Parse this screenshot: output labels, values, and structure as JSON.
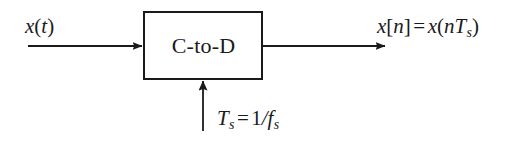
{
  "diagram": {
    "background_color": "#ffffff",
    "stroke_color": "#1a1a1a",
    "block": {
      "label": "C-to-D",
      "x": 143,
      "y": 11,
      "width": 120,
      "height": 69,
      "border_width": 2,
      "fill": "#ffffff"
    },
    "labels": {
      "input_signal": "x(t)",
      "output_signal": "x[n] = x(nTs)",
      "sampling_period": "Ts = 1/fs"
    },
    "label_parts": {
      "input": {
        "var": "x",
        "open": "(",
        "arg": "t",
        "close": ")"
      },
      "output": {
        "lhs_var": "x",
        "lhs_open": "[",
        "lhs_arg": "n",
        "lhs_close": "]",
        "operator": "=",
        "rhs_var": "x",
        "rhs_open": "(",
        "rhs_arg": "n",
        "rhs_sym": "T",
        "rhs_sub": "s",
        "rhs_close": ")"
      },
      "sampling": {
        "sym": "T",
        "sym_sub": "s",
        "operator": "=",
        "numerator": "1",
        "slash": "/",
        "denominator": "f",
        "denominator_sub": "s"
      }
    },
    "arrows": [
      {
        "name": "input-arrow",
        "direction": "right",
        "x1": 28,
        "y1": 46,
        "x2": 143,
        "y2": 46
      },
      {
        "name": "output-arrow",
        "direction": "right",
        "x1": 263,
        "y1": 46,
        "x2": 386,
        "y2": 46
      },
      {
        "name": "clock-arrow",
        "direction": "up",
        "x1": 203,
        "y1": 131,
        "x2": 203,
        "y2": 80
      }
    ]
  }
}
